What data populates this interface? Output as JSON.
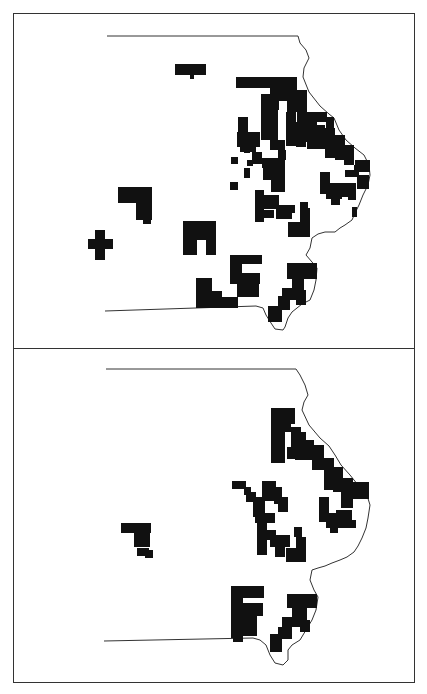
{
  "figure": {
    "colors": {
      "fill": "#111111",
      "outline": "#333333",
      "background": "#ffffff"
    },
    "panels": [
      {
        "id": "top",
        "description": "Map panel 1 - shaded county units",
        "cells": [
          [
            175,
            64,
            31,
            11
          ],
          [
            190,
            75,
            4,
            4
          ],
          [
            236,
            77,
            48,
            11
          ],
          [
            270,
            88,
            9,
            22
          ],
          [
            261,
            94,
            17,
            34
          ],
          [
            279,
            77,
            8,
            24
          ],
          [
            287,
            77,
            10,
            35
          ],
          [
            297,
            90,
            10,
            22
          ],
          [
            286,
            112,
            10,
            34
          ],
          [
            297,
            112,
            10,
            22
          ],
          [
            307,
            112,
            10,
            37
          ],
          [
            317,
            112,
            10,
            10
          ],
          [
            326,
            117,
            8,
            13
          ],
          [
            238,
            117,
            10,
            15
          ],
          [
            237,
            132,
            23,
            15
          ],
          [
            244,
            147,
            6,
            6
          ],
          [
            261,
            128,
            17,
            12
          ],
          [
            270,
            140,
            15,
            10
          ],
          [
            278,
            150,
            8,
            10
          ],
          [
            296,
            122,
            10,
            25
          ],
          [
            306,
            132,
            10,
            10
          ],
          [
            315,
            125,
            10,
            24
          ],
          [
            325,
            128,
            10,
            30
          ],
          [
            335,
            135,
            10,
            25
          ],
          [
            344,
            145,
            10,
            20
          ],
          [
            336,
            153,
            8,
            6
          ],
          [
            355,
            160,
            15,
            12
          ],
          [
            354,
            165,
            16,
            6
          ],
          [
            345,
            170,
            9,
            7
          ],
          [
            353,
            170,
            6,
            7
          ],
          [
            357,
            175,
            12,
            14
          ],
          [
            240,
            142,
            16,
            10
          ],
          [
            252,
            152,
            10,
            12
          ],
          [
            247,
            160,
            6,
            6
          ],
          [
            262,
            158,
            10,
            10
          ],
          [
            270,
            158,
            15,
            10
          ],
          [
            263,
            168,
            22,
            12
          ],
          [
            271,
            180,
            14,
            12
          ],
          [
            231,
            157,
            7,
            7
          ],
          [
            244,
            168,
            6,
            10
          ],
          [
            262,
            195,
            10,
            10
          ],
          [
            230,
            182,
            8,
            8
          ],
          [
            320,
            172,
            10,
            22
          ],
          [
            326,
            183,
            16,
            16
          ],
          [
            338,
            183,
            18,
            14
          ],
          [
            331,
            195,
            9,
            10
          ],
          [
            348,
            192,
            8,
            8
          ],
          [
            352,
            207,
            5,
            10
          ],
          [
            255,
            190,
            9,
            32
          ],
          [
            264,
            195,
            15,
            14
          ],
          [
            264,
            210,
            10,
            8
          ],
          [
            276,
            205,
            16,
            14
          ],
          [
            290,
            205,
            5,
            8
          ],
          [
            300,
            202,
            8,
            12
          ],
          [
            288,
            222,
            22,
            15
          ],
          [
            300,
            208,
            10,
            14
          ],
          [
            118,
            187,
            34,
            16
          ],
          [
            136,
            200,
            16,
            20
          ],
          [
            143,
            218,
            8,
            6
          ],
          [
            88,
            239,
            25,
            10
          ],
          [
            95,
            230,
            10,
            30
          ],
          [
            183,
            221,
            33,
            19
          ],
          [
            183,
            240,
            14,
            15
          ],
          [
            206,
            240,
            10,
            15
          ],
          [
            230,
            255,
            32,
            9
          ],
          [
            230,
            264,
            12,
            20
          ],
          [
            242,
            273,
            18,
            11
          ],
          [
            237,
            284,
            22,
            13
          ],
          [
            196,
            278,
            16,
            30
          ],
          [
            212,
            291,
            10,
            17
          ],
          [
            221,
            297,
            17,
            11
          ],
          [
            287,
            263,
            30,
            16
          ],
          [
            292,
            279,
            12,
            12
          ],
          [
            282,
            288,
            16,
            12
          ],
          [
            278,
            296,
            12,
            14
          ],
          [
            268,
            306,
            14,
            16
          ],
          [
            296,
            290,
            10,
            15
          ]
        ]
      },
      {
        "id": "bottom",
        "description": "Map panel 2 - shaded county units",
        "cells": [
          [
            271,
            408,
            14,
            55
          ],
          [
            285,
            408,
            10,
            16
          ],
          [
            285,
            420,
            6,
            12
          ],
          [
            291,
            427,
            10,
            20
          ],
          [
            287,
            447,
            18,
            12
          ],
          [
            295,
            432,
            11,
            28
          ],
          [
            304,
            440,
            10,
            20
          ],
          [
            312,
            445,
            12,
            25
          ],
          [
            324,
            458,
            10,
            32
          ],
          [
            333,
            467,
            10,
            25
          ],
          [
            341,
            478,
            12,
            30
          ],
          [
            353,
            482,
            16,
            17
          ],
          [
            232,
            481,
            14,
            8
          ],
          [
            244,
            487,
            7,
            8
          ],
          [
            246,
            492,
            10,
            10
          ],
          [
            253,
            497,
            12,
            20
          ],
          [
            262,
            481,
            14,
            20
          ],
          [
            274,
            487,
            8,
            17
          ],
          [
            278,
            497,
            10,
            15
          ],
          [
            319,
            497,
            10,
            25
          ],
          [
            326,
            513,
            14,
            15
          ],
          [
            336,
            510,
            16,
            18
          ],
          [
            330,
            525,
            8,
            8
          ],
          [
            350,
            520,
            6,
            8
          ],
          [
            255,
            513,
            20,
            10
          ],
          [
            257,
            523,
            10,
            32
          ],
          [
            266,
            530,
            10,
            10
          ],
          [
            270,
            535,
            20,
            12
          ],
          [
            275,
            547,
            10,
            10
          ],
          [
            294,
            527,
            8,
            10
          ],
          [
            296,
            537,
            10,
            25
          ],
          [
            286,
            548,
            14,
            14
          ],
          [
            121,
            523,
            30,
            10
          ],
          [
            134,
            530,
            8,
            17
          ],
          [
            140,
            530,
            10,
            17
          ],
          [
            137,
            548,
            12,
            8
          ],
          [
            145,
            550,
            8,
            8
          ],
          [
            231,
            586,
            33,
            12
          ],
          [
            231,
            598,
            12,
            40
          ],
          [
            243,
            603,
            20,
            13
          ],
          [
            243,
            616,
            14,
            20
          ],
          [
            233,
            630,
            10,
            12
          ],
          [
            287,
            594,
            30,
            14
          ],
          [
            292,
            608,
            15,
            12
          ],
          [
            282,
            617,
            18,
            10
          ],
          [
            278,
            627,
            14,
            12
          ],
          [
            270,
            634,
            12,
            18
          ],
          [
            300,
            620,
            10,
            12
          ]
        ]
      }
    ]
  }
}
